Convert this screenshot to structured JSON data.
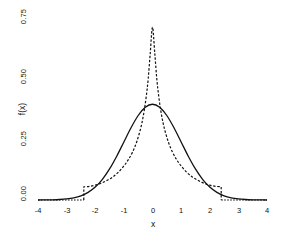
{
  "chart_data": {
    "type": "line",
    "title": "",
    "xlabel": "x",
    "ylabel": "f(x)",
    "xlim": [
      -4,
      4
    ],
    "ylim": [
      0.0,
      0.78
    ],
    "grid": false,
    "legend": "none",
    "background": "#ffffff",
    "ink_color": "#111111",
    "xticks": [
      -4,
      -3,
      -2,
      -1,
      0,
      1,
      2,
      3,
      4
    ],
    "xticklabels": [
      "-4",
      "-3",
      "-2",
      "-1",
      "0",
      "1",
      "2",
      "3",
      "4"
    ],
    "yticks": [
      0.0,
      0.25,
      0.5,
      0.75
    ],
    "yticklabels": [
      "0.00",
      "0.25",
      "0.50",
      "0.75"
    ],
    "series": [
      {
        "name": "solid-density",
        "style": "solid",
        "color": "#111111",
        "linewidth": 1.3,
        "peak_x": 0,
        "peak_y": 0.399,
        "support": [
          -4,
          4
        ],
        "x": [
          -4.0,
          -3.75,
          -3.5,
          -3.25,
          -3.0,
          -2.75,
          -2.5,
          -2.25,
          -2.0,
          -1.75,
          -1.5,
          -1.25,
          -1.0,
          -0.75,
          -0.5,
          -0.25,
          0.0,
          0.25,
          0.5,
          0.75,
          1.0,
          1.25,
          1.5,
          1.75,
          2.0,
          2.25,
          2.5,
          2.75,
          3.0,
          3.25,
          3.5,
          3.75,
          4.0
        ],
        "y": [
          0.0001,
          0.0004,
          0.0009,
          0.002,
          0.0044,
          0.0091,
          0.0175,
          0.0317,
          0.054,
          0.0863,
          0.1295,
          0.1826,
          0.242,
          0.3011,
          0.3521,
          0.3867,
          0.3989,
          0.3867,
          0.3521,
          0.3011,
          0.242,
          0.1826,
          0.1295,
          0.0863,
          0.054,
          0.0317,
          0.0175,
          0.0091,
          0.0044,
          0.002,
          0.0009,
          0.0004,
          0.0001
        ]
      },
      {
        "name": "dashed-density",
        "style": "dashed",
        "color": "#111111",
        "linewidth": 1.2,
        "peak_x": 0,
        "peak_y": 0.72,
        "support": [
          -2.4,
          2.4
        ],
        "step_discontinuity_x": [
          -2.4,
          2.4
        ],
        "step_value_at_edge": 0.055,
        "x": [
          -2.4,
          -2.4,
          -2.2,
          -2.0,
          -1.8,
          -1.6,
          -1.4,
          -1.2,
          -1.0,
          -0.85,
          -0.7,
          -0.55,
          -0.4,
          -0.3,
          -0.22,
          -0.15,
          -0.08,
          0.0,
          0.08,
          0.15,
          0.22,
          0.3,
          0.4,
          0.55,
          0.7,
          0.85,
          1.0,
          1.2,
          1.4,
          1.6,
          1.8,
          2.0,
          2.2,
          2.4,
          2.4
        ],
        "y": [
          0.0,
          0.055,
          0.057,
          0.062,
          0.07,
          0.081,
          0.095,
          0.115,
          0.142,
          0.167,
          0.199,
          0.243,
          0.305,
          0.365,
          0.43,
          0.505,
          0.61,
          0.72,
          0.61,
          0.505,
          0.43,
          0.365,
          0.305,
          0.243,
          0.199,
          0.167,
          0.142,
          0.115,
          0.095,
          0.081,
          0.07,
          0.062,
          0.057,
          0.055,
          0.0
        ]
      }
    ]
  }
}
